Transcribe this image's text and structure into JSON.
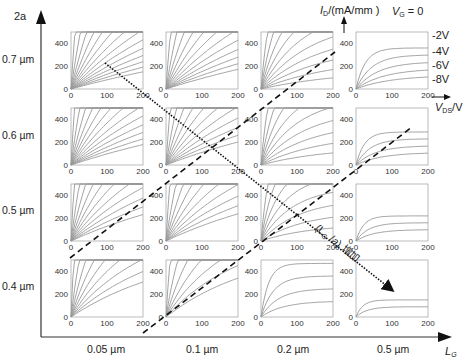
{
  "figure": {
    "y_axis_label": "2a",
    "x_axis_label_main": "L",
    "x_axis_label_sub": "G",
    "row_labels": [
      "0.7 µm",
      "0.6 µm",
      "0.5 µm",
      "0.4 µm"
    ],
    "col_labels": [
      "0.05 µm",
      "0.1 µm",
      "0.2 µm",
      "0.5 µm"
    ],
    "id_label_main": "I",
    "id_label_sub": "D",
    "id_label_unit": "/(mA/mm )",
    "vds_label_main": "V",
    "vds_label_sub": "DS",
    "vds_label_unit": "/V",
    "vg_label_main": "V",
    "vg_label_sub": "G",
    "vg_label_eq": " = 0",
    "vg_legend": [
      "-2V",
      "-4V",
      "-6V",
      "-8V"
    ],
    "annotation": "(L_G / a) 增加",
    "annotation_parts": {
      "open": "(L",
      "sub": "G",
      "mid": " /",
      "a": "a",
      "close": ") 增加"
    }
  },
  "chart_data": {
    "type": "line",
    "title": "",
    "row_param": {
      "name": "2a",
      "values": [
        "0.7 µm",
        "0.6 µm",
        "0.5 µm",
        "0.4 µm"
      ]
    },
    "col_param": {
      "name": "L_G",
      "values": [
        "0.05 µm",
        "0.1 µm",
        "0.2 µm",
        "0.5 µm"
      ]
    },
    "xlabel": "V_DS/V",
    "ylabel": "I_D/(mA/mm)",
    "xlim": [
      0,
      200
    ],
    "ylim": [
      0,
      500
    ],
    "xticks": [
      0,
      100,
      200
    ],
    "yticks": [
      0,
      200,
      400
    ],
    "series_legend": [
      "V_G = 0",
      "-2V",
      "-4V",
      "-6V",
      "-8V"
    ],
    "subplots_visible_curves": [
      [
        14,
        12,
        10,
        5
      ],
      [
        13,
        11,
        9,
        4
      ],
      [
        11,
        10,
        8,
        3
      ],
      [
        9,
        7,
        4,
        2
      ]
    ],
    "annotations": [
      {
        "type": "dashed-line",
        "meaning": "boundary between regimes (upper)"
      },
      {
        "type": "dashed-line",
        "meaning": "boundary between regimes (lower)"
      },
      {
        "type": "dotted-arrow",
        "text": "(L_G/a) 增加",
        "direction": "down-right"
      }
    ]
  }
}
